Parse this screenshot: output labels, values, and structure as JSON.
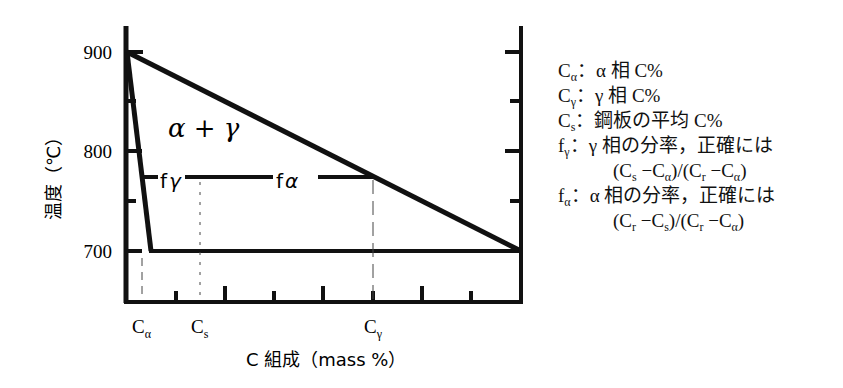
{
  "diagram": {
    "y_axis": {
      "label": "温度（℃）",
      "ticks": [
        {
          "value": 900,
          "label": "900",
          "y": 52
        },
        {
          "value": 800,
          "label": "800",
          "y": 151
        },
        {
          "value": 700,
          "label": "700",
          "y": 251
        }
      ]
    },
    "x_axis": {
      "label": "C 組成（mass %）",
      "ticks": [
        {
          "label": "C",
          "sub": "α",
          "x": 142
        },
        {
          "label": "C",
          "sub": "s",
          "x": 200
        },
        {
          "label": "C",
          "sub": "γ",
          "x": 373
        }
      ]
    },
    "region_label": "α + γ",
    "lever_labels": {
      "f_gamma": "f",
      "f_gamma_sub": "γ",
      "f_alpha": "f",
      "f_alpha_sub": "α"
    },
    "colors": {
      "line": "#111111",
      "background": "#ffffff"
    }
  },
  "legend": {
    "items": [
      {
        "sym": "C",
        "sub": "α",
        "text": "：α 相 C%"
      },
      {
        "sym": "C",
        "sub": "γ",
        "text": "：γ 相 C%"
      },
      {
        "sym": "C",
        "sub": "s",
        "text": "：鋼板の平均 C%"
      },
      {
        "sym": "f",
        "sub": "γ",
        "text": "：γ 相の分率，正確には"
      },
      {
        "formula": "(C_s − C_α)/(C_r − C_α)"
      },
      {
        "sym": "f",
        "sub": "α",
        "text": "：α 相の分率，正確には"
      },
      {
        "formula": "(C_r − C_s)/(C_r − C_α)"
      }
    ]
  }
}
